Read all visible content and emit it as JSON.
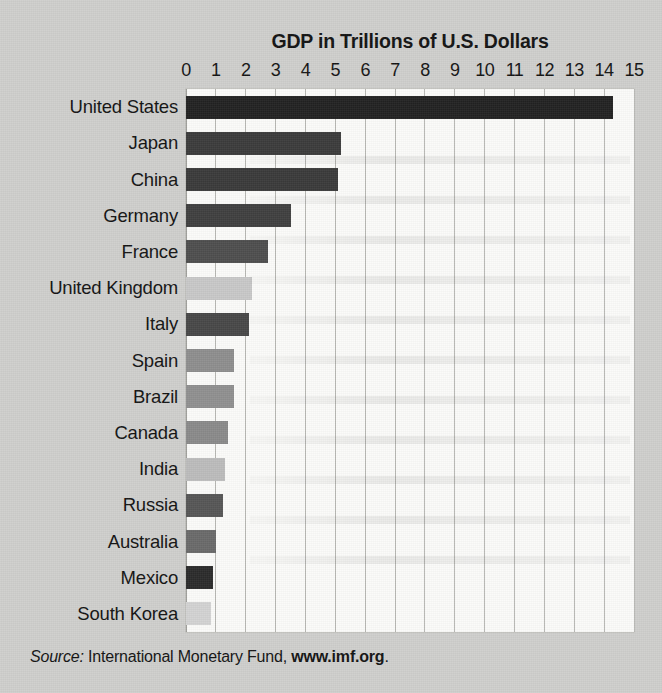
{
  "chart_data": {
    "type": "bar",
    "orientation": "horizontal",
    "title": "GDP in Trillions of U.S. Dollars",
    "xlabel": "",
    "ylabel": "",
    "xlim": [
      0,
      15
    ],
    "grid": true,
    "legend": "none",
    "xticks": [
      "0",
      "1",
      "2",
      "3",
      "4",
      "5",
      "6",
      "7",
      "8",
      "9",
      "10",
      "11",
      "12",
      "13",
      "14",
      "15"
    ],
    "categories": [
      "United States",
      "Japan",
      "China",
      "Germany",
      "France",
      "United Kingdom",
      "Italy",
      "Spain",
      "Brazil",
      "Canada",
      "India",
      "Russia",
      "Australia",
      "Mexico",
      "South Korea"
    ],
    "values": [
      14.3,
      5.2,
      5.1,
      3.5,
      2.75,
      2.2,
      2.1,
      1.6,
      1.6,
      1.4,
      1.3,
      1.25,
      1.0,
      0.9,
      0.85
    ],
    "bar_colors": [
      "#222222",
      "#3b3b3b",
      "#3a3a3a",
      "#3f3f3f",
      "#4e4e4e",
      "#c8c8c8",
      "#484848",
      "#8e8e8e",
      "#909090",
      "#8a8a8a",
      "#bcbcbc",
      "#565656",
      "#6a6a6a",
      "#2b2b2b",
      "#d3d3d3"
    ]
  },
  "source": {
    "label": "Source:",
    "text": " International Monetary Fund, ",
    "url": "www.imf.org",
    "period": "."
  },
  "colors": {
    "page_background": "#cfcfcd",
    "plot_background": "#fbfbf9",
    "gridline": "#b8b8b4",
    "text": "#131313"
  }
}
